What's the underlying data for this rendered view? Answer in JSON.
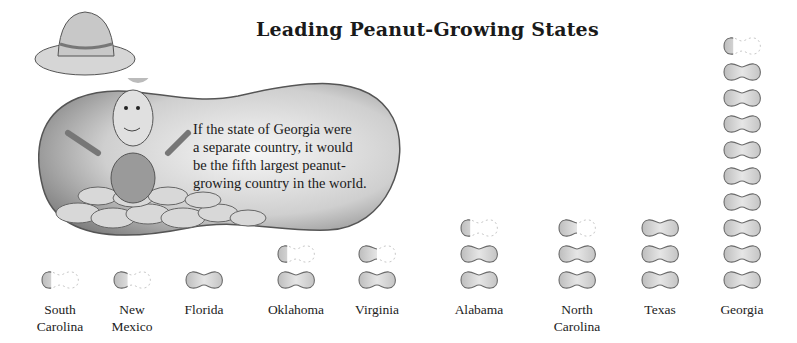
{
  "chart_data": {
    "type": "pictograph",
    "title": "Leading Peanut-Growing States",
    "xlabel": "",
    "ylabel": "",
    "categories": [
      "South Carolina",
      "New Mexico",
      "Florida",
      "Oklahoma",
      "Virginia",
      "Alabama",
      "North Carolina",
      "Texas",
      "Georgia"
    ],
    "values": [
      0.3,
      0.4,
      1,
      1.3,
      1.5,
      2.3,
      2.5,
      3,
      9.3
    ],
    "unit": "peanut symbols",
    "annotation": "If the state of Georgia were a separate country, it would be the fifth largest peanut-growing country in the world."
  },
  "title": "Leading Peanut-Growing States",
  "callout": {
    "lines": [
      "If the state of Georgia were",
      "a separate country, it would",
      "be the fifth largest peanut-",
      "growing country in the world."
    ]
  },
  "states": [
    {
      "line1": "South",
      "line2": "Carolina",
      "full": 0,
      "partial": 0.3,
      "x": 60
    },
    {
      "line1": "New",
      "line2": "Mexico",
      "full": 0,
      "partial": 0.4,
      "x": 132
    },
    {
      "line1": "Florida",
      "line2": "",
      "full": 1,
      "partial": 0,
      "x": 204
    },
    {
      "line1": "Oklahoma",
      "line2": "",
      "full": 1,
      "partial": 0.3,
      "x": 296
    },
    {
      "line1": "Virginia",
      "line2": "",
      "full": 1,
      "partial": 0.5,
      "x": 377
    },
    {
      "line1": "Alabama",
      "line2": "",
      "full": 2,
      "partial": 0.3,
      "x": 479
    },
    {
      "line1": "North",
      "line2": "Carolina",
      "full": 2,
      "partial": 0.5,
      "x": 577
    },
    {
      "line1": "Texas",
      "line2": "",
      "full": 3,
      "partial": 0,
      "x": 660
    },
    {
      "line1": "Georgia",
      "line2": "",
      "full": 9,
      "partial": 0.3,
      "x": 742
    }
  ]
}
